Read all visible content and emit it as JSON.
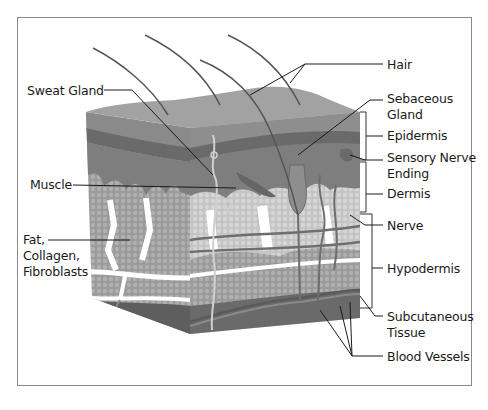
{
  "diagram": {
    "colors": {
      "background": "#ffffff",
      "frame": "#8a8a8a",
      "surface": "#9c9c9c",
      "epidermis_light": "#8e8e8e",
      "epidermis_dark": "#6a6a6a",
      "dermis": "#7e7e7e",
      "fat": "#9a9a9a",
      "fat_light": "#b9b9b9",
      "base": "#5e5e5e",
      "leader_line": "#1a1a1a",
      "text": "#1a1a1a"
    },
    "labels_left": [
      {
        "id": "sweat-gland",
        "lines": [
          "Sweat Gland"
        ]
      },
      {
        "id": "muscle",
        "lines": [
          "Muscle"
        ]
      },
      {
        "id": "fat",
        "lines": [
          "Fat,",
          "Collagen,",
          "Fibroblasts"
        ]
      }
    ],
    "labels_right": [
      {
        "id": "hair",
        "lines": [
          "Hair"
        ]
      },
      {
        "id": "sebaceous-gland",
        "lines": [
          "Sebaceous",
          "Gland"
        ]
      },
      {
        "id": "epidermis",
        "lines": [
          "Epidermis"
        ]
      },
      {
        "id": "sensory-nerve-ending",
        "lines": [
          "Sensory Nerve",
          "Ending"
        ]
      },
      {
        "id": "dermis",
        "lines": [
          "Dermis"
        ]
      },
      {
        "id": "nerve",
        "lines": [
          "Nerve"
        ]
      },
      {
        "id": "hypodermis",
        "lines": [
          "Hypodermis"
        ]
      },
      {
        "id": "subcutaneous-tissue",
        "lines": [
          "Subcutaneous",
          "Tissue"
        ]
      },
      {
        "id": "blood-vessels",
        "lines": [
          "Blood Vessels"
        ]
      }
    ]
  }
}
